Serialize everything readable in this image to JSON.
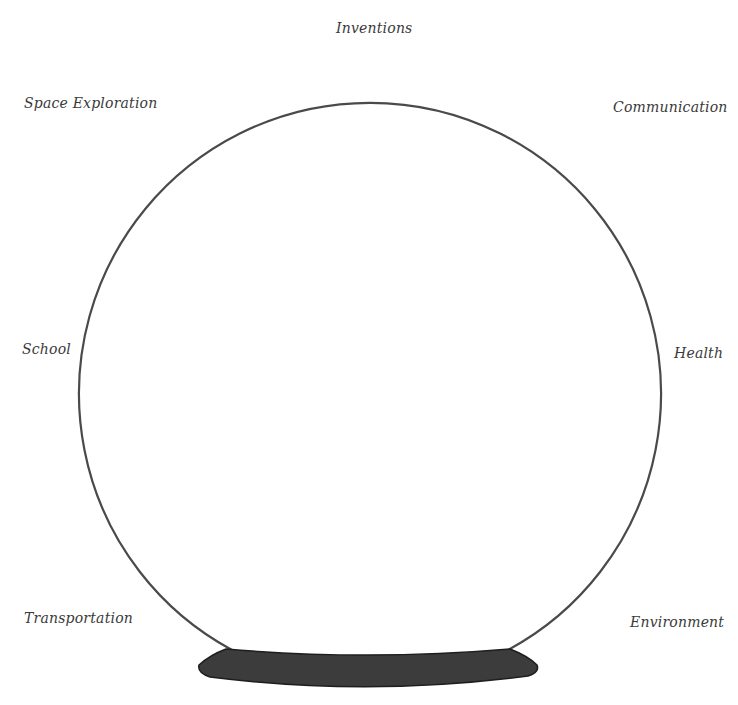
{
  "diagram": {
    "type": "crystal-ball-graphic-organizer",
    "labels": {
      "top": "Inventions",
      "top_left": "Space Exploration",
      "top_right": "Communication",
      "middle_left": "School",
      "middle_right": "Health",
      "bottom_left": "Transportation",
      "bottom_right": "Environment"
    },
    "colors": {
      "outline": "#4a4a4a",
      "base_fill": "#3c3c3c",
      "label_text": "#3a3a3a",
      "background": "#ffffff"
    }
  }
}
